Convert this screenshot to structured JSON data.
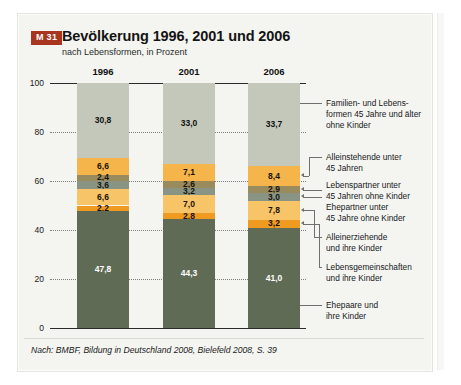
{
  "panel": {
    "badge": "M 31",
    "title": "Bevölkerung 1996, 2001 und 2006",
    "subtitle": "nach Lebensformen, in Prozent",
    "source": "Nach: BMBF, Bildung in Deutschland 2008, Bielefeld 2008, S. 39",
    "accent_color": "#a8361f",
    "background_color": "#f4f5f1"
  },
  "chart_data": {
    "type": "bar",
    "stacked": true,
    "title": "Bevölkerung 1996, 2001 und 2006",
    "subtitle": "nach Lebensformen, in Prozent",
    "xlabel": "",
    "ylabel": "",
    "ylim": [
      0,
      100
    ],
    "yticks": [
      "0",
      "20",
      "40",
      "60",
      "80",
      "100"
    ],
    "grid": "dotted-horizontal",
    "legend_position": "right",
    "categories": [
      "1996",
      "2001",
      "2006"
    ],
    "series": [
      {
        "name": "Familien- und Lebensformen 45 Jahre und älter ohne Kinder",
        "color": "#c3c8bb",
        "text_color": "#111111",
        "values": [
          30.8,
          33.0,
          33.7
        ],
        "labels": [
          "30,8",
          "33,0",
          "33,7"
        ]
      },
      {
        "name": "Alleinstehende unter 45 Jahren",
        "color": "#f5b54a",
        "text_color": "#1a1208",
        "values": [
          6.6,
          7.1,
          8.4
        ],
        "labels": [
          "6,6",
          "7,1",
          "8,4"
        ]
      },
      {
        "name": "Lebenspartner unter 45 Jahren ohne Kinder",
        "color": "#9a8b5c",
        "text_color": "#1a1208",
        "values": [
          2.4,
          2.6,
          2.9
        ],
        "labels": [
          "2,4",
          "2,6",
          "2,9"
        ]
      },
      {
        "name": "Ehepartner unter 45 Jahre ohne Kinder",
        "color": "#8a9484",
        "text_color": "#15150f",
        "values": [
          3.6,
          3.2,
          3.0
        ],
        "labels": [
          "3,6",
          "3,2",
          "3,0"
        ]
      },
      {
        "name": "Alleinerziehende und ihre Kinder",
        "color": "#f7c468",
        "text_color": "#1a1208",
        "values": [
          6.6,
          7.0,
          7.8
        ],
        "labels": [
          "6,6",
          "7,0",
          "7,8"
        ]
      },
      {
        "name": "Lebensgemeinschaften und ihre Kinder",
        "color": "#ef9b22",
        "text_color": "#1a1208",
        "values": [
          2.2,
          2.8,
          3.2
        ],
        "labels": [
          "2,2",
          "2,8",
          "3,2"
        ]
      },
      {
        "name": "Ehepaare und ihre Kinder",
        "color": "#5f6b55",
        "text_color": "#ffffff",
        "values": [
          47.8,
          44.3,
          41.0
        ],
        "labels": [
          "47,8",
          "44,3",
          "41,0"
        ]
      }
    ],
    "legend_entries": [
      {
        "line1": "Familien- und Lebens-",
        "line2": "formen 45 Jahre und älter",
        "line3": "ohne Kinder"
      },
      {
        "line1": "Alleinstehende unter",
        "line2": "45 Jahren",
        "line3": ""
      },
      {
        "line1": "Lebenspartner unter",
        "line2": "45 Jahren ohne Kinder",
        "line3": ""
      },
      {
        "line1": "Ehepartner unter",
        "line2": "45 Jahre ohne Kinder",
        "line3": ""
      },
      {
        "line1": "Alleinerziehende",
        "line2": "und ihre Kinder",
        "line3": ""
      },
      {
        "line1": "Lebensgemeinschaften",
        "line2": "und ihre Kinder",
        "line3": ""
      },
      {
        "line1": "Ehepaare und",
        "line2": "ihre Kinder",
        "line3": ""
      }
    ]
  }
}
